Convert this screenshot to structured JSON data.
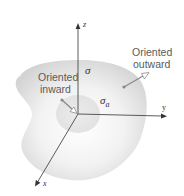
{
  "diagram": {
    "axes": {
      "z_label": "z",
      "y_label": "y",
      "x_label": "x"
    },
    "surface_label": "σ",
    "subsurface_label": "σ",
    "subsurface_subscript": "a",
    "annotations": {
      "outward_line1": "Oriented",
      "outward_line2": "outward",
      "inward_line1": "Oriented",
      "inward_line2": "inward"
    },
    "colors": {
      "surface_edge": "#d6d6d6",
      "surface_center": "#ffffff",
      "disc": "#e6e6e6",
      "axis": "#4a4a4a",
      "arrow_stem": "#8a8a8a"
    }
  }
}
